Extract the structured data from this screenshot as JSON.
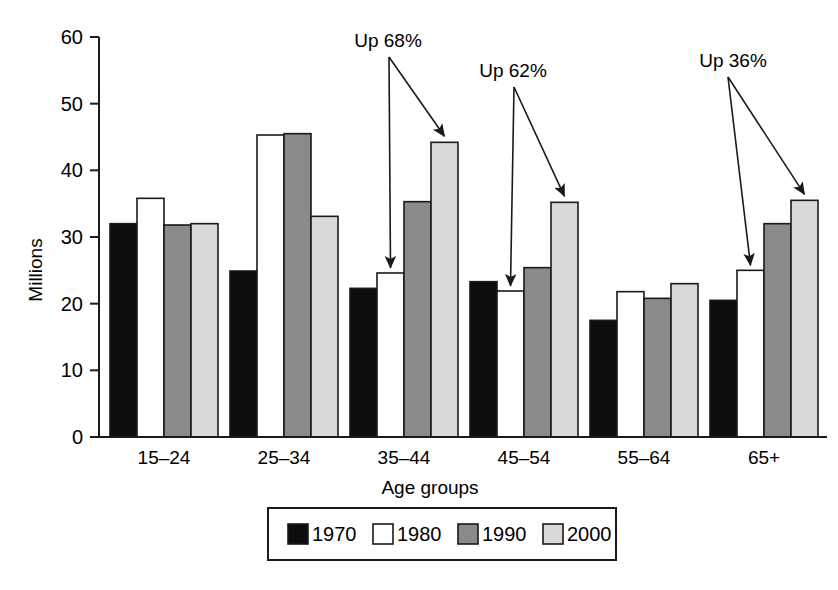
{
  "chart_data": {
    "type": "bar",
    "title": "",
    "xlabel": "Age groups",
    "ylabel": "Millions",
    "categories": [
      "15–24",
      "25–34",
      "35–44",
      "45–54",
      "55–64",
      "65+"
    ],
    "series": [
      {
        "name": "1970",
        "color": "#0d0d0d",
        "values": [
          32.0,
          24.9,
          22.3,
          23.3,
          17.5,
          20.5
        ]
      },
      {
        "name": "1980",
        "color": "#ffffff",
        "values": [
          35.8,
          45.3,
          24.6,
          21.9,
          21.8,
          25.0
        ]
      },
      {
        "name": "1990",
        "color": "#8a8a8a",
        "values": [
          31.8,
          45.5,
          35.3,
          25.4,
          20.8,
          32.0
        ]
      },
      {
        "name": "2000",
        "color": "#d9d9d9",
        "values": [
          32.0,
          33.1,
          44.2,
          35.2,
          23.0,
          35.5
        ]
      }
    ],
    "ylim": [
      0,
      60
    ],
    "yticks": [
      0,
      10,
      20,
      30,
      40,
      50,
      60
    ],
    "ytick_labels": [
      "0",
      "10",
      "20",
      "30",
      "40",
      "50",
      "60"
    ],
    "grid": false,
    "legend_position": "bottom",
    "annotations": [
      {
        "text": "Up 68%",
        "category": "35–44",
        "from_series": "1980",
        "to_series": "2000"
      },
      {
        "text": "Up 62%",
        "category": "45–54",
        "from_series": "1980",
        "to_series": "2000"
      },
      {
        "text": "Up 36%",
        "category": "65+",
        "from_series": "1980",
        "to_series": "2000"
      }
    ]
  },
  "legend": {
    "items": [
      {
        "label": "1970",
        "color": "#0d0d0d"
      },
      {
        "label": "1980",
        "color": "#ffffff"
      },
      {
        "label": "1990",
        "color": "#8a8a8a"
      },
      {
        "label": "2000",
        "color": "#d9d9d9"
      }
    ]
  },
  "axes": {
    "y_title": "Millions",
    "x_title": "Age groups"
  }
}
